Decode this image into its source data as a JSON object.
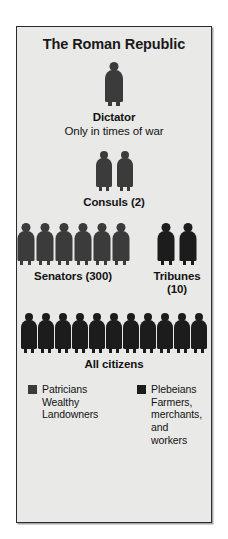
{
  "poster": {
    "title": "The Roman Republic",
    "background_color": "#e9e9e7",
    "border_color": "#2b2b2b",
    "text_color": "#131313"
  },
  "figure_colors": {
    "patrician": "#3b3b3b",
    "plebeian": "#1c1c1c"
  },
  "tiers": [
    {
      "id": "dictator",
      "label": "Dictator",
      "sublabel": "Only in times of war",
      "figure_count": 1,
      "figure_class": "patrician",
      "figure_height_px": 44
    },
    {
      "id": "consuls",
      "label": "Consuls (2)",
      "sublabel": "",
      "figure_count": 2,
      "figure_class": "patrician",
      "figure_height_px": 40
    },
    {
      "id": "senators",
      "label": "Senators (300)",
      "sublabel": "",
      "figure_count": 6,
      "figure_class": "patrician",
      "figure_height_px": 42
    },
    {
      "id": "tribunes",
      "label": "Tribunes (10)",
      "sublabel": "",
      "figure_count": 2,
      "figure_class": "plebeian",
      "figure_height_px": 42
    },
    {
      "id": "all-citizens",
      "label": "All citizens",
      "sublabel": "",
      "figure_count": 11,
      "figure_class": "plebeian",
      "figure_height_px": 40
    }
  ],
  "legend": {
    "patricians": {
      "swatch_color": "#3b3b3b",
      "name": "Patricians",
      "description": "Wealthy Landowners"
    },
    "plebeians": {
      "swatch_color": "#1c1c1c",
      "name": "Plebeians",
      "description": "Farmers, merchants, and workers"
    }
  }
}
